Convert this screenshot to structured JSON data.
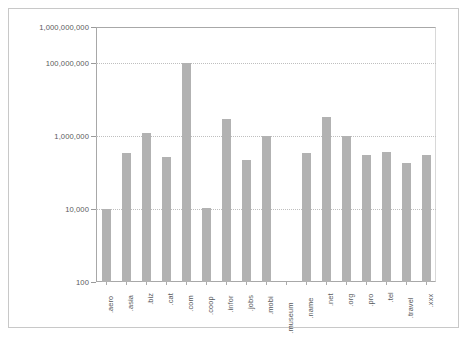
{
  "chart_data": {
    "type": "bar",
    "title": "",
    "subtitle": "",
    "xlabel": "",
    "ylabel": "",
    "yscale": "log",
    "ylim": [
      100,
      1000000000
    ],
    "grid": true,
    "legend": null,
    "y_tick_labels": [
      "1,000,000,000",
      "100,000,000",
      "1,000,000",
      "10,000",
      "100"
    ],
    "y_tick_values": [
      1000000000,
      100000000,
      1000000,
      10000,
      100
    ],
    "categories": [
      ".aero",
      ".asia",
      ".biz",
      ".cat",
      ".com",
      ".coop",
      ".infor",
      ".jobs",
      ".mobi",
      ".museum",
      ".name",
      ".net",
      ".org",
      ".pro",
      ".tel",
      ".travel",
      ".xxx"
    ],
    "values": [
      10000,
      350000,
      1200000,
      270000,
      100000000,
      11000,
      3000000,
      220000,
      1000000,
      null,
      340000,
      3300000,
      1000000,
      300000,
      380000,
      190000,
      310000
    ],
    "bar_color": "#b2b2b2",
    "axis_color": "#a8a8a8",
    "grid_color": "#bfbfbf",
    "text_color": "#58595b",
    "background": "#ffffff",
    "border_color": "#c8c8c8"
  }
}
